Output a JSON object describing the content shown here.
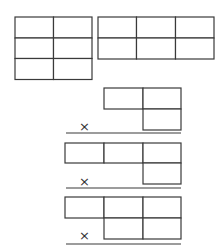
{
  "diagram": {
    "colors": {
      "line": "#3a3a3a",
      "background": "#ffffff"
    },
    "top_grids": [
      {
        "name": "grid-2x3",
        "columns": 2,
        "rows": 3
      },
      {
        "name": "grid-3x2",
        "columns": 3,
        "rows": 2
      }
    ],
    "problems": [
      {
        "name": "problem-1",
        "operator": "×",
        "row1_boxes": 2,
        "row2_boxes": 1
      },
      {
        "name": "problem-2",
        "operator": "×",
        "row1_boxes": 3,
        "row2_boxes": 1
      },
      {
        "name": "problem-3",
        "operator": "×",
        "row1_boxes": 3,
        "row2_boxes": 2
      }
    ]
  }
}
